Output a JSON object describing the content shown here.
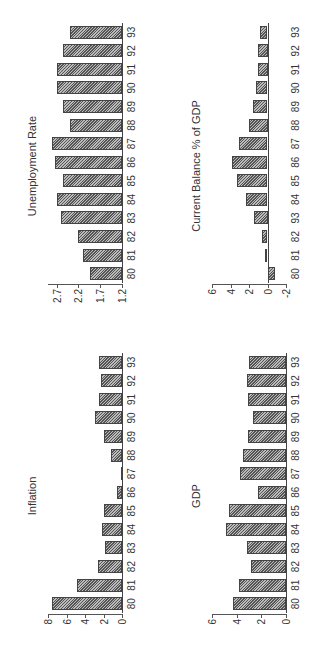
{
  "chart_data": [
    {
      "type": "bar",
      "title": "Unemployment Rate",
      "categories": [
        "80",
        "81",
        "82",
        "83",
        "84",
        "85",
        "86",
        "87",
        "88",
        "89",
        "90",
        "91",
        "92",
        "93"
      ],
      "values": [
        1.93,
        2.1,
        2.2,
        2.6,
        2.7,
        2.55,
        2.75,
        2.8,
        2.4,
        2.55,
        2.7,
        2.7,
        2.55,
        2.4
      ],
      "yticks": [
        "1.2",
        "1.7",
        "2.2",
        "2.7"
      ],
      "ylim": [
        1.2,
        2.9
      ],
      "xlabel": "",
      "ylabel": ""
    },
    {
      "type": "bar",
      "title": "Current Balance % of GDP",
      "categories": [
        "80",
        "81",
        "82",
        "93",
        "84",
        "85",
        "86",
        "87",
        "88",
        "89",
        "90",
        "91",
        "92",
        "93"
      ],
      "values": [
        -0.8,
        0.3,
        0.6,
        1.5,
        2.3,
        3.3,
        3.8,
        3.1,
        2.0,
        1.6,
        1.2,
        1.0,
        1.0,
        0.8
      ],
      "yticks": [
        "-2",
        "0",
        "2",
        "4",
        "6"
      ],
      "ylim": [
        -2,
        6
      ],
      "xlabel": "",
      "ylabel": ""
    },
    {
      "type": "bar",
      "title": "Inflation",
      "categories": [
        "80",
        "81",
        "82",
        "83",
        "84",
        "85",
        "86",
        "87",
        "88",
        "89",
        "90",
        "91",
        "92",
        "93"
      ],
      "values": [
        7.6,
        4.9,
        2.6,
        1.8,
        2.2,
        2.0,
        0.5,
        0.1,
        1.2,
        2.0,
        2.9,
        2.5,
        2.3,
        2.5
      ],
      "yticks": [
        "0",
        "2",
        "4",
        "6",
        "8"
      ],
      "ylim": [
        0,
        8
      ],
      "xlabel": "",
      "ylabel": ""
    },
    {
      "type": "bar",
      "title": "GDP",
      "categories": [
        "80",
        "81",
        "82",
        "83",
        "84",
        "85",
        "86",
        "87",
        "88",
        "89",
        "90",
        "91",
        "92",
        "93"
      ],
      "values": [
        4.3,
        3.8,
        2.8,
        3.2,
        4.9,
        4.6,
        2.3,
        3.7,
        3.5,
        3.1,
        2.7,
        3.1,
        3.2,
        3.0
      ],
      "yticks": [
        "0",
        "2",
        "4",
        "6"
      ],
      "ylim": [
        0,
        6
      ],
      "xlabel": "",
      "ylabel": ""
    }
  ],
  "layout": {
    "orientation": "rotated 90deg counter-clockwise",
    "panels": [
      "Inflation",
      "Unemployment Rate",
      "GDP",
      "Current Balance % of GDP"
    ]
  },
  "colors": {
    "bar_fill": "#888888",
    "bar_edge": "#444444",
    "background": "#ffffff"
  }
}
